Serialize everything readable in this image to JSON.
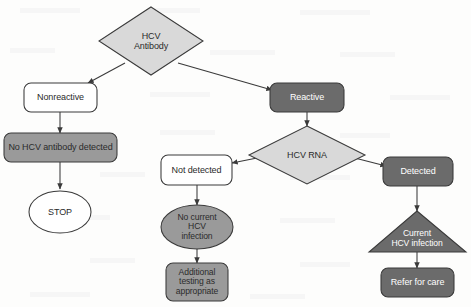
{
  "diagram": {
    "type": "flowchart",
    "colors": {
      "background": "#fdfdfc",
      "diamond_fill": "#d9d9d9",
      "white_fill": "#ffffff",
      "mid_gray_fill": "#9a9a9a",
      "dark_gray_fill": "#6b6b6b",
      "stroke": "#3a3a3a",
      "dark_text": "#2b2b2b",
      "light_text": "#ffffff"
    },
    "nodes": [
      {
        "id": "hcv-antibody",
        "label": "HCV\nAntibody",
        "shape": "diamond",
        "fill": "#d9d9d9",
        "text_color": "#2b2b2b"
      },
      {
        "id": "nonreactive",
        "label": "Nonreactive",
        "shape": "rounded",
        "fill": "#ffffff",
        "text_color": "#2b2b2b"
      },
      {
        "id": "no-antibody",
        "label": "No HCV antibody detected",
        "shape": "rounded",
        "fill": "#9a9a9a",
        "text_color": "#2b2b2b"
      },
      {
        "id": "stop",
        "label": "STOP",
        "shape": "ellipse",
        "fill": "#ffffff",
        "text_color": "#2b2b2b"
      },
      {
        "id": "reactive",
        "label": "Reactive",
        "shape": "rounded",
        "fill": "#6b6b6b",
        "text_color": "#ffffff"
      },
      {
        "id": "hcv-rna",
        "label": "HCV RNA",
        "shape": "diamond",
        "fill": "#d9d9d9",
        "text_color": "#2b2b2b"
      },
      {
        "id": "not-detected",
        "label": "Not detected",
        "shape": "rounded",
        "fill": "#ffffff",
        "text_color": "#2b2b2b"
      },
      {
        "id": "no-current",
        "label": "No current\nHCV\ninfection",
        "shape": "ellipse",
        "fill": "#9a9a9a",
        "text_color": "#2b2b2b"
      },
      {
        "id": "additional-testing",
        "label": "Additional\ntesting as\nappropriate",
        "shape": "rounded",
        "fill": "#9a9a9a",
        "text_color": "#2b2b2b"
      },
      {
        "id": "detected",
        "label": "Detected",
        "shape": "rounded",
        "fill": "#6b6b6b",
        "text_color": "#ffffff"
      },
      {
        "id": "current-infection",
        "label": "Current\nHCV infection",
        "shape": "triangle",
        "fill": "#6b6b6b",
        "text_color": "#ffffff"
      },
      {
        "id": "refer-for-care",
        "label": "Refer for care",
        "shape": "rounded",
        "fill": "#6b6b6b",
        "text_color": "#ffffff"
      }
    ],
    "edges": [
      {
        "from": "hcv-antibody",
        "to": "nonreactive"
      },
      {
        "from": "hcv-antibody",
        "to": "reactive"
      },
      {
        "from": "nonreactive",
        "to": "no-antibody"
      },
      {
        "from": "no-antibody",
        "to": "stop"
      },
      {
        "from": "reactive",
        "to": "hcv-rna"
      },
      {
        "from": "hcv-rna",
        "to": "not-detected"
      },
      {
        "from": "hcv-rna",
        "to": "detected"
      },
      {
        "from": "not-detected",
        "to": "no-current"
      },
      {
        "from": "no-current",
        "to": "additional-testing"
      },
      {
        "from": "detected",
        "to": "current-infection"
      },
      {
        "from": "current-infection",
        "to": "refer-for-care"
      }
    ]
  }
}
